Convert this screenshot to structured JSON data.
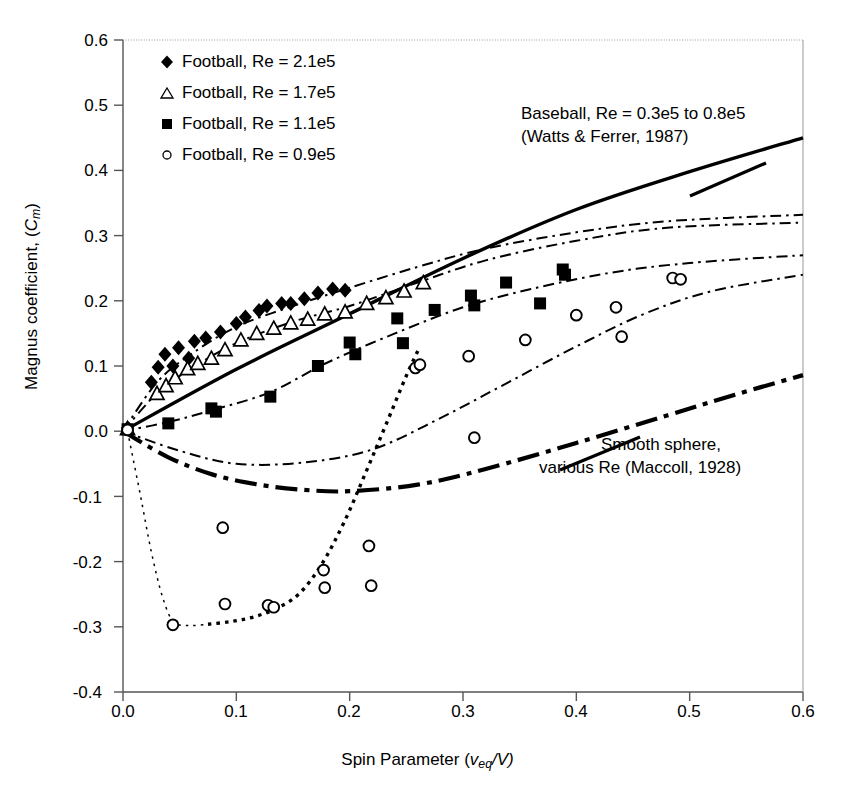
{
  "axes": {
    "x_label_prefix": "Spin Parameter (",
    "x_label_var": "v",
    "x_label_sub": "eq",
    "x_label_suffix": "/V)",
    "y_label_prefix": "Magnus coefficient, (",
    "y_label_var": "C",
    "y_label_sub": "m",
    "y_label_suffix": ")",
    "x_ticks": [
      "0.0",
      "0.1",
      "0.2",
      "0.3",
      "0.4",
      "0.5",
      "0.6"
    ],
    "y_ticks": [
      "0.6",
      "0.5",
      "0.4",
      "0.3",
      "0.2",
      "0.1",
      "0.0",
      "-0.1",
      "-0.2",
      "-0.3",
      "-0.4"
    ]
  },
  "legend": [
    {
      "marker": "filled-diamond",
      "label": "Football, Re = 2.1e5"
    },
    {
      "marker": "open-triangle",
      "label": "Football, Re = 1.7e5"
    },
    {
      "marker": "filled-square",
      "label": "Football, Re = 1.1e5"
    },
    {
      "marker": "open-circle",
      "label": "Football, Re = 0.9e5"
    }
  ],
  "annotations": [
    {
      "name": "baseball-annotation",
      "line1": "Baseball, Re = 0.3e5 to 0.8e5",
      "line2": "(Watts & Ferrer, 1987)"
    },
    {
      "name": "smooth-sphere-annotation",
      "line1": "Smooth sphere,",
      "line2": "various Re (Maccoll, 1928)"
    }
  ],
  "colors": {
    "ink": "#000000",
    "frame_light": "#9a9a9a"
  },
  "chart_data": {
    "type": "scatter",
    "title": "",
    "xlabel": "Spin Parameter (v_eq/V)",
    "ylabel": "Magnus coefficient, (C_m)",
    "xlim": [
      0.0,
      0.6
    ],
    "ylim": [
      -0.4,
      0.6
    ],
    "grid": false,
    "legend_position": "upper-left",
    "series": [
      {
        "name": "Football, Re = 2.1e5",
        "marker": "filled-diamond",
        "points": [
          [
            0.004,
            0.005
          ],
          [
            0.025,
            0.075
          ],
          [
            0.031,
            0.098
          ],
          [
            0.037,
            0.118
          ],
          [
            0.044,
            0.1
          ],
          [
            0.049,
            0.128
          ],
          [
            0.058,
            0.112
          ],
          [
            0.063,
            0.138
          ],
          [
            0.073,
            0.143
          ],
          [
            0.086,
            0.152
          ],
          [
            0.1,
            0.165
          ],
          [
            0.108,
            0.175
          ],
          [
            0.12,
            0.185
          ],
          [
            0.127,
            0.192
          ],
          [
            0.14,
            0.196
          ],
          [
            0.148,
            0.196
          ],
          [
            0.16,
            0.203
          ],
          [
            0.172,
            0.212
          ],
          [
            0.185,
            0.218
          ],
          [
            0.196,
            0.216
          ]
        ]
      },
      {
        "name": "Football, Re = 1.7e5",
        "marker": "open-triangle",
        "points": [
          [
            0.004,
            0.004
          ],
          [
            0.03,
            0.058
          ],
          [
            0.038,
            0.07
          ],
          [
            0.046,
            0.082
          ],
          [
            0.057,
            0.096
          ],
          [
            0.066,
            0.104
          ],
          [
            0.078,
            0.112
          ],
          [
            0.09,
            0.125
          ],
          [
            0.104,
            0.14
          ],
          [
            0.118,
            0.15
          ],
          [
            0.133,
            0.158
          ],
          [
            0.148,
            0.166
          ],
          [
            0.163,
            0.172
          ],
          [
            0.178,
            0.18
          ],
          [
            0.196,
            0.183
          ],
          [
            0.215,
            0.196
          ],
          [
            0.232,
            0.205
          ],
          [
            0.248,
            0.215
          ],
          [
            0.265,
            0.228
          ]
        ]
      },
      {
        "name": "Football, Re = 1.1e5",
        "marker": "filled-square",
        "points": [
          [
            0.004,
            0.003
          ],
          [
            0.04,
            0.012
          ],
          [
            0.078,
            0.035
          ],
          [
            0.082,
            0.03
          ],
          [
            0.13,
            0.053
          ],
          [
            0.172,
            0.1
          ],
          [
            0.2,
            0.136
          ],
          [
            0.205,
            0.118
          ],
          [
            0.242,
            0.173
          ],
          [
            0.247,
            0.135
          ],
          [
            0.275,
            0.186
          ],
          [
            0.307,
            0.208
          ],
          [
            0.31,
            0.193
          ],
          [
            0.338,
            0.228
          ],
          [
            0.368,
            0.196
          ],
          [
            0.388,
            0.248
          ],
          [
            0.39,
            0.24
          ]
        ]
      },
      {
        "name": "Football, Re = 0.9e5",
        "marker": "open-circle",
        "points": [
          [
            0.004,
            0.002
          ],
          [
            0.044,
            -0.297
          ],
          [
            0.088,
            -0.148
          ],
          [
            0.09,
            -0.265
          ],
          [
            0.128,
            -0.267
          ],
          [
            0.133,
            -0.27
          ],
          [
            0.177,
            -0.213
          ],
          [
            0.178,
            -0.24
          ],
          [
            0.217,
            -0.176
          ],
          [
            0.219,
            -0.237
          ],
          [
            0.258,
            0.097
          ],
          [
            0.262,
            0.102
          ],
          [
            0.305,
            0.115
          ],
          [
            0.31,
            -0.01
          ],
          [
            0.355,
            0.14
          ],
          [
            0.4,
            0.178
          ],
          [
            0.435,
            0.19
          ],
          [
            0.44,
            0.145
          ],
          [
            0.485,
            0.235
          ],
          [
            0.492,
            0.233
          ]
        ]
      }
    ],
    "reference_curves": [
      {
        "name": "Baseball, Re = 0.3e5 to 0.8e5 (Watts & Ferrer, 1987)",
        "style": "solid-thick",
        "points": [
          [
            0.0,
            0.0
          ],
          [
            0.1,
            0.095
          ],
          [
            0.2,
            0.18
          ],
          [
            0.3,
            0.265
          ],
          [
            0.4,
            0.34
          ],
          [
            0.5,
            0.398
          ],
          [
            0.6,
            0.45
          ]
        ]
      },
      {
        "name": "Smooth sphere, various Re (Maccoll, 1928)",
        "style": "dash-dot-thick",
        "points": [
          [
            0.0,
            0.0
          ],
          [
            0.04,
            -0.04
          ],
          [
            0.08,
            -0.067
          ],
          [
            0.12,
            -0.082
          ],
          [
            0.16,
            -0.09
          ],
          [
            0.2,
            -0.092
          ],
          [
            0.26,
            -0.082
          ],
          [
            0.32,
            -0.058
          ],
          [
            0.4,
            -0.018
          ],
          [
            0.48,
            0.024
          ],
          [
            0.54,
            0.056
          ],
          [
            0.6,
            0.086
          ]
        ]
      },
      {
        "name": "Football trend Re = 2.1e5",
        "style": "dash-dot-thin",
        "points": [
          [
            0.0,
            0.0
          ],
          [
            0.03,
            0.075
          ],
          [
            0.06,
            0.118
          ],
          [
            0.1,
            0.16
          ],
          [
            0.15,
            0.192
          ],
          [
            0.2,
            0.22
          ],
          [
            0.26,
            0.252
          ],
          [
            0.32,
            0.28
          ],
          [
            0.4,
            0.305
          ],
          [
            0.48,
            0.322
          ],
          [
            0.6,
            0.332
          ]
        ]
      },
      {
        "name": "Football trend Re = 1.7e5",
        "style": "dash-dot-thin",
        "points": [
          [
            0.0,
            0.0
          ],
          [
            0.03,
            0.058
          ],
          [
            0.06,
            0.096
          ],
          [
            0.1,
            0.135
          ],
          [
            0.15,
            0.168
          ],
          [
            0.2,
            0.192
          ],
          [
            0.26,
            0.228
          ],
          [
            0.32,
            0.262
          ],
          [
            0.4,
            0.292
          ],
          [
            0.48,
            0.312
          ],
          [
            0.6,
            0.32
          ]
        ]
      },
      {
        "name": "Football trend Re = 1.1e5",
        "style": "dash-dot-thin",
        "points": [
          [
            0.0,
            0.0
          ],
          [
            0.04,
            0.014
          ],
          [
            0.08,
            0.033
          ],
          [
            0.13,
            0.06
          ],
          [
            0.18,
            0.105
          ],
          [
            0.24,
            0.15
          ],
          [
            0.3,
            0.19
          ],
          [
            0.36,
            0.218
          ],
          [
            0.43,
            0.243
          ],
          [
            0.5,
            0.258
          ],
          [
            0.6,
            0.27
          ]
        ]
      },
      {
        "name": "Football trend Re = 0.9e5 upper",
        "style": "dash-dot-thin",
        "points": [
          [
            0.0,
            0.0
          ],
          [
            0.05,
            -0.03
          ],
          [
            0.1,
            -0.05
          ],
          [
            0.16,
            -0.048
          ],
          [
            0.22,
            -0.028
          ],
          [
            0.28,
            0.02
          ],
          [
            0.34,
            0.075
          ],
          [
            0.4,
            0.13
          ],
          [
            0.46,
            0.18
          ],
          [
            0.52,
            0.215
          ],
          [
            0.6,
            0.24
          ]
        ]
      },
      {
        "name": "Football trend Re = 0.9e5 descent",
        "style": "dotted-thin",
        "points": [
          [
            0.004,
            0.0
          ],
          [
            0.015,
            -0.095
          ],
          [
            0.025,
            -0.185
          ],
          [
            0.035,
            -0.255
          ],
          [
            0.045,
            -0.293
          ],
          [
            0.06,
            -0.298
          ],
          [
            0.075,
            -0.296
          ]
        ]
      },
      {
        "name": "Football trend Re = 0.9e5 recovery",
        "style": "dotted-thick",
        "points": [
          [
            0.075,
            -0.296
          ],
          [
            0.095,
            -0.292
          ],
          [
            0.115,
            -0.285
          ],
          [
            0.135,
            -0.272
          ],
          [
            0.155,
            -0.25
          ],
          [
            0.175,
            -0.205
          ],
          [
            0.195,
            -0.14
          ],
          [
            0.215,
            -0.06
          ],
          [
            0.232,
            0.01
          ],
          [
            0.25,
            0.085
          ],
          [
            0.262,
            0.13
          ]
        ]
      }
    ]
  }
}
